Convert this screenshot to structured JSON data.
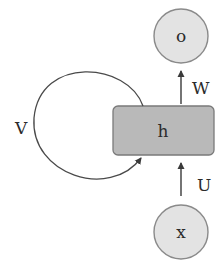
{
  "diagram": {
    "type": "recurrent-neural-network-unit",
    "colors": {
      "circle_fill": "#e3e3e3",
      "circle_stroke": "#8a8a8a",
      "box_fill": "#b9b9b9",
      "box_stroke": "#7a7a7a",
      "line": "#4a4a4a",
      "text": "#2b2b2b"
    },
    "nodes": {
      "output": {
        "label": "o",
        "shape": "circle"
      },
      "hidden": {
        "label": "h",
        "shape": "rounded-rectangle"
      },
      "input": {
        "label": "x",
        "shape": "circle"
      }
    },
    "edges": {
      "hidden_to_output": {
        "label": "W",
        "from": "h",
        "to": "o"
      },
      "input_to_hidden": {
        "label": "U",
        "from": "x",
        "to": "h"
      },
      "recurrent": {
        "label": "V",
        "from": "h",
        "to": "h"
      }
    }
  }
}
